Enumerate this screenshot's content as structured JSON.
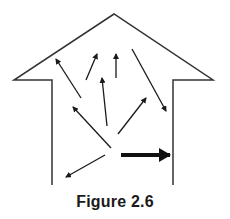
{
  "figure": {
    "caption": "Figure 2.6",
    "stroke_color": "#1a1a1a",
    "house_outline": {
      "points": [
        [
          52,
          185
        ],
        [
          52,
          80
        ],
        [
          14,
          80
        ],
        [
          114,
          14
        ],
        [
          213,
          80
        ],
        [
          173,
          80
        ],
        [
          173,
          185
        ]
      ]
    },
    "thin_arrows": [
      {
        "from": [
          81,
          98
        ],
        "to": [
          56,
          59
        ]
      },
      {
        "from": [
          86,
          80
        ],
        "to": [
          97,
          54
        ]
      },
      {
        "from": [
          116,
          78
        ],
        "to": [
          116,
          54
        ]
      },
      {
        "from": [
          132,
          49
        ],
        "to": [
          166,
          111
        ]
      },
      {
        "from": [
          107,
          126
        ],
        "to": [
          102,
          78
        ]
      },
      {
        "from": [
          118,
          134
        ],
        "to": [
          146,
          98
        ]
      },
      {
        "from": [
          111,
          148
        ],
        "to": [
          73,
          107
        ]
      },
      {
        "from": [
          105,
          155
        ],
        "to": [
          66,
          177
        ]
      }
    ],
    "thick_arrow": {
      "from": [
        121,
        155
      ],
      "to": [
        170,
        155
      ]
    }
  }
}
